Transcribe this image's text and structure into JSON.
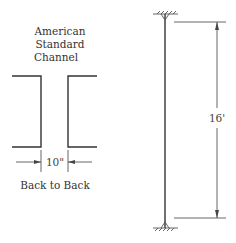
{
  "section_label": {
    "lines": [
      "American",
      "Standard",
      "Channel"
    ]
  },
  "spacing": {
    "value": "10\"",
    "caption": "Back to Back"
  },
  "column": {
    "length_label": "16'",
    "top_support": "fixed-support",
    "bottom_support": "fixed-support"
  }
}
